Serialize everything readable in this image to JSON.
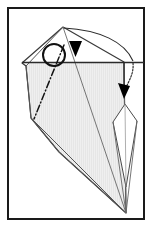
{
  "figure": {
    "caption": "",
    "canvas": {
      "width": 152,
      "height": 227
    },
    "colors": {
      "background": "#ffffff",
      "frame_stroke": "#1a1a1a",
      "paper_fill": "#e4e4e4",
      "paper_fill_light": "#ededed",
      "crease_stroke": "#555555",
      "edge_stroke": "#3a3a3a",
      "arrow_fill": "#000000",
      "highlight_white": "#ffffff"
    },
    "frame": {
      "name": "diagram-border",
      "x": 7,
      "y": 7,
      "width": 137,
      "height": 212,
      "stroke_width": 2
    },
    "shapes": {
      "paper_outline": {
        "label": "folded-paper-body",
        "points": "63,27 22,63 26,66 31,118 59,152 126,213 124,62 63,27"
      },
      "paper_main": {
        "label": "shaded-paper-face",
        "points": "63,27 26,66 31,118 59,152 126,213 124,62"
      },
      "left_flap": {
        "label": "left-flap-edge",
        "points": "63,27 22,63 26,66 31,118 59,152"
      },
      "white_kite": {
        "label": "white-kite-flap",
        "points": "125,105 137,120 126,186 113,122"
      },
      "top_triangle": {
        "label": "upper-white-triangle",
        "points": "63,27 30,62 124,62"
      }
    },
    "creases": [
      {
        "name": "crease-apex-to-bottom",
        "d": "M63,27 L126,213",
        "style": "solid"
      },
      {
        "name": "crease-left-fold",
        "d": "M63,27 L31,118",
        "style": "solid"
      },
      {
        "name": "crease-lower-left-to-point",
        "d": "M31,118 L126,213",
        "style": "solid"
      },
      {
        "name": "crease-center-long",
        "d": "M59,152 L126,213",
        "style": "solid"
      },
      {
        "name": "crease-kite-left",
        "d": "M113,122 L126,213",
        "style": "solid"
      },
      {
        "name": "crease-kite-right",
        "d": "M137,120 L126,213",
        "style": "solid"
      },
      {
        "name": "crease-right-spine",
        "d": "M124,62 L126,213",
        "style": "solid"
      }
    ],
    "dash_dot_line": {
      "name": "valley-fold-dash-dot-line",
      "d": "M63,40 L35,118",
      "style": "dash-dot"
    },
    "horizontal_fold_line": {
      "name": "horizontal-fold-edge",
      "d": "M22,62 L144,62"
    },
    "annotations": [
      {
        "name": "fold-arrow-curve-left",
        "type": "curved-arrow",
        "path": "M63,27 C95,28 120,42 132,62",
        "arrowhead_at": {
          "x": 75,
          "y": 48
        },
        "arrowhead_direction": "down",
        "style": "solid"
      },
      {
        "name": "fold-arrow-curve-right",
        "type": "curved-arrow",
        "path": "M132,62 C133,72 128,80 124,90",
        "arrowhead_at": {
          "x": 124,
          "y": 95
        },
        "arrowhead_direction": "down",
        "style": "dotted"
      }
    ],
    "circle_marker": {
      "name": "reference-point-circle",
      "cx": 54,
      "cy": 55,
      "r": 11,
      "stroke_width": 2,
      "fill": "none"
    },
    "arrowheads": [
      {
        "name": "arrowhead-down-left",
        "x": 75,
        "y": 42,
        "width": 13,
        "height": 16
      },
      {
        "name": "arrowhead-down-right",
        "x": 124,
        "y": 82,
        "width": 11,
        "height": 14,
        "rotate": -20
      }
    ],
    "step_number": ""
  }
}
